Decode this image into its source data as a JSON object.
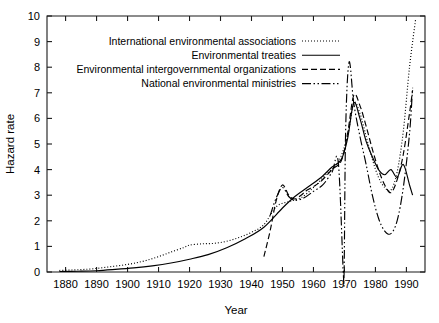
{
  "chart_data": {
    "type": "line",
    "title": "",
    "xlabel": "Year",
    "ylabel": "Hazard rate",
    "xlim": [
      1874,
      1996
    ],
    "ylim": [
      0,
      10
    ],
    "grid": false,
    "legend_position": "top-center",
    "xticks": [
      1880,
      1890,
      1900,
      1910,
      1920,
      1930,
      1940,
      1950,
      1960,
      1970,
      1980,
      1990
    ],
    "yticks": [
      0,
      1,
      2,
      3,
      4,
      5,
      6,
      7,
      8,
      9,
      10
    ],
    "series": [
      {
        "name": "International environmental associations",
        "style": "dotted",
        "dash": "1,2",
        "x": [
          1878,
          1882,
          1886,
          1890,
          1894,
          1898,
          1902,
          1906,
          1910,
          1914,
          1918,
          1920,
          1924,
          1928,
          1932,
          1936,
          1940,
          1944,
          1948,
          1952,
          1956,
          1960,
          1964,
          1968,
          1971,
          1973,
          1975,
          1977,
          1979,
          1981,
          1983,
          1985,
          1987,
          1989,
          1991,
          1993
        ],
        "y": [
          0.06,
          0.08,
          0.1,
          0.14,
          0.2,
          0.26,
          0.34,
          0.45,
          0.6,
          0.78,
          0.95,
          1.05,
          1.1,
          1.12,
          1.2,
          1.35,
          1.55,
          1.85,
          2.55,
          2.75,
          2.9,
          3.3,
          3.8,
          4.3,
          5.3,
          6.6,
          6.2,
          5.3,
          4.4,
          3.7,
          3.3,
          3.2,
          3.9,
          5.5,
          8.0,
          9.9
        ]
      },
      {
        "name": "Environmental treaties",
        "style": "solid",
        "dash": "none",
        "x": [
          1878,
          1884,
          1890,
          1896,
          1902,
          1908,
          1914,
          1920,
          1926,
          1932,
          1938,
          1944,
          1950,
          1954,
          1958,
          1962,
          1966,
          1969,
          1971,
          1973,
          1975,
          1977,
          1979,
          1981,
          1983,
          1985,
          1987,
          1989,
          1991,
          1992
        ],
        "y": [
          0.02,
          0.03,
          0.05,
          0.1,
          0.16,
          0.24,
          0.35,
          0.5,
          0.68,
          0.95,
          1.3,
          1.75,
          2.5,
          2.95,
          3.3,
          3.65,
          4.1,
          4.4,
          5.2,
          6.6,
          6.0,
          5.1,
          4.5,
          4.0,
          3.8,
          4.0,
          3.7,
          4.2,
          3.4,
          3.0
        ]
      },
      {
        "name": "Environmental intergovernmental organizations",
        "style": "dashed",
        "dash": "6,3",
        "x": [
          1944,
          1946,
          1948,
          1950,
          1952,
          1954,
          1956,
          1958,
          1962,
          1966,
          1969,
          1971,
          1973,
          1975,
          1977,
          1979,
          1981,
          1983,
          1985,
          1987,
          1989,
          1991,
          1992
        ],
        "y": [
          0.6,
          1.6,
          2.8,
          3.4,
          3.0,
          2.85,
          3.0,
          3.2,
          3.5,
          4.0,
          4.35,
          5.4,
          6.9,
          6.5,
          5.7,
          4.8,
          4.0,
          3.4,
          3.1,
          3.6,
          4.6,
          6.2,
          7.1
        ]
      },
      {
        "name": "National environmental ministries",
        "style": "dashdot",
        "dash": "9,2.5,1.5,2.5,1.5,2.5",
        "x": [
          1946,
          1948,
          1950,
          1952,
          1954,
          1957,
          1960,
          1963,
          1966,
          1968,
          1969.6,
          1969.9,
          1970.4,
          1971.5,
          1973,
          1975,
          1977,
          1979,
          1981,
          1983,
          1985,
          1987,
          1989,
          1991,
          1992
        ],
        "y": [
          2.2,
          2.9,
          3.3,
          2.95,
          2.8,
          2.9,
          3.15,
          3.4,
          3.9,
          4.3,
          0.05,
          0.05,
          5.6,
          8.2,
          6.6,
          5.3,
          4.2,
          3.0,
          2.1,
          1.6,
          1.5,
          2.0,
          3.3,
          5.4,
          7.2
        ]
      }
    ]
  },
  "legend": {
    "items": [
      {
        "label": "International environmental associations",
        "dash": "1,2"
      },
      {
        "label": "Environmental treaties",
        "dash": "none"
      },
      {
        "label": "Environmental intergovernmental organizations",
        "dash": "6,3"
      },
      {
        "label": "National environmental ministries",
        "dash": "9,2.5,1.5,2.5,1.5,2.5"
      }
    ]
  },
  "colors": {
    "line": "#000000",
    "axis": "#1a1a1a",
    "background": "#ffffff"
  }
}
